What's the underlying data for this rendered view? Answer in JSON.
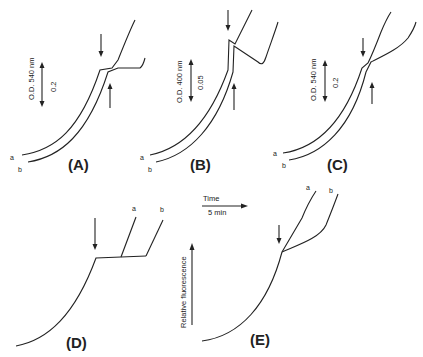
{
  "figure": {
    "panels": [
      {
        "id": "A",
        "label": "(A)",
        "axis_label": "O.D. 540 nm",
        "scale_label": "0.2",
        "trace_labels": [
          "a",
          "b"
        ]
      },
      {
        "id": "B",
        "label": "(B)",
        "axis_label": "O.D. 400 nm",
        "scale_label": "0.05",
        "trace_labels": [
          "a",
          "b"
        ]
      },
      {
        "id": "C",
        "label": "(C)",
        "axis_label": "O.D. 540 nm",
        "scale_label": "0.2",
        "trace_labels": [
          "a",
          "b"
        ]
      },
      {
        "id": "D",
        "label": "(D)",
        "trace_labels": [
          "a",
          "b"
        ]
      },
      {
        "id": "E",
        "label": "(E)",
        "trace_labels": [
          "a",
          "b"
        ]
      }
    ],
    "time_scale": {
      "title": "Time",
      "value": "5 min"
    },
    "fluorescence_axis": {
      "label": "Relative fluorescence"
    }
  },
  "colors": {
    "ink": "#222222",
    "background": "#ffffff"
  }
}
